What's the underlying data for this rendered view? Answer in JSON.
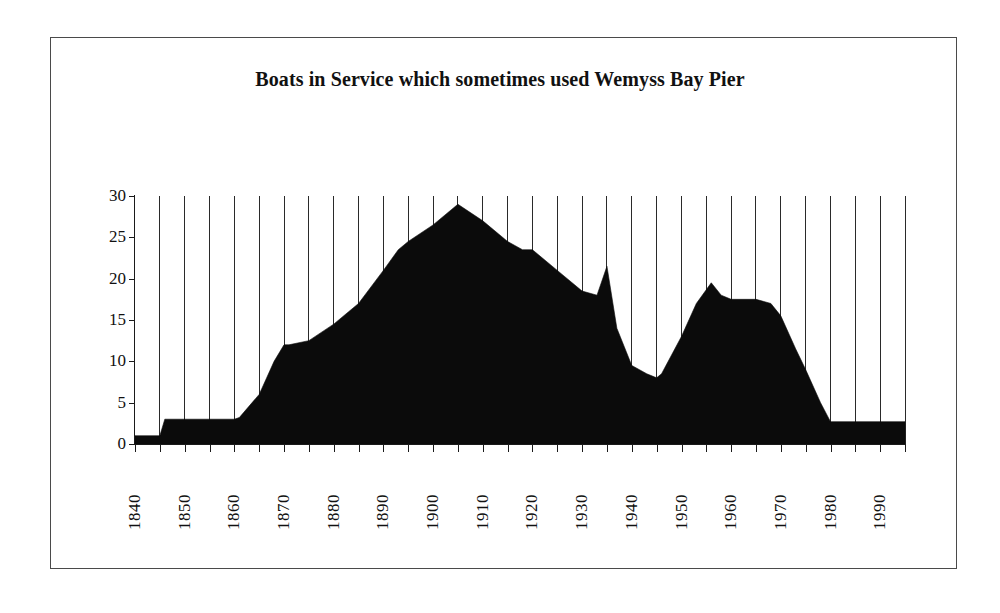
{
  "figure": {
    "title": "Boats in Service which sometimes used Wemyss Bay Pier",
    "background_color": "#ffffff",
    "frame_color": "#4a4a4a",
    "series_color": "#0b0b0b",
    "gridline_color": "#2a2a2a"
  },
  "axes": {
    "y_tick_labels": [
      "30",
      "25",
      "20",
      "15",
      "10",
      "5",
      "0"
    ],
    "x_tick_labels": [
      "1840",
      "1850",
      "1860",
      "1870",
      "1880",
      "1890",
      "1900",
      "1910",
      "1920",
      "1930",
      "1940",
      "1950",
      "1960",
      "1970",
      "1980",
      "1990"
    ]
  },
  "chart_data": {
    "type": "area",
    "title": "Boats in Service which sometimes used Wemyss Bay Pier",
    "xlabel": "",
    "ylabel": "",
    "xlim": [
      1840,
      1995
    ],
    "ylim": [
      0,
      30
    ],
    "y_ticks": [
      0,
      5,
      10,
      15,
      20,
      25,
      30
    ],
    "x_ticks": [
      1840,
      1850,
      1860,
      1870,
      1880,
      1890,
      1900,
      1910,
      1920,
      1930,
      1940,
      1950,
      1960,
      1970,
      1980,
      1990
    ],
    "x_minor_tick_step": 5,
    "grid": "vertical gridlines every 5 years",
    "legend": "none",
    "series_name": "Boats in service",
    "x": [
      1840,
      1845,
      1846,
      1850,
      1855,
      1860,
      1861,
      1865,
      1868,
      1870,
      1871,
      1875,
      1880,
      1883,
      1885,
      1890,
      1893,
      1895,
      1900,
      1905,
      1910,
      1915,
      1918,
      1920,
      1922,
      1925,
      1930,
      1933,
      1935,
      1937,
      1940,
      1943,
      1945,
      1946,
      1950,
      1953,
      1956,
      1958,
      1960,
      1965,
      1968,
      1970,
      1973,
      1975,
      1978,
      1980,
      1985,
      1990,
      1995
    ],
    "y": [
      1,
      1,
      3,
      3,
      3,
      3,
      3.2,
      6,
      10,
      12,
      12,
      12.5,
      14.5,
      16,
      17,
      21,
      23.5,
      24.5,
      26.5,
      29,
      27,
      24.5,
      23.5,
      23.5,
      22.5,
      21,
      18.5,
      18,
      21.5,
      14,
      9.5,
      8.5,
      8,
      8.5,
      13,
      17,
      19.5,
      18,
      17.5,
      17.5,
      17,
      15.5,
      11.5,
      9,
      5,
      2.7,
      2.7,
      2.7,
      2.7
    ]
  }
}
